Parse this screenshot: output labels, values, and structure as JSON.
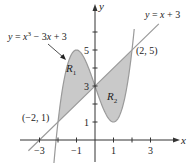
{
  "figure": {
    "type": "area-between-curves",
    "curves": [
      {
        "name": "cubic",
        "label": "y = x³ − 3x + 3",
        "label_parts": {
          "lhs": "y",
          "eq": " = ",
          "x": "x",
          "exp": "3",
          "rest": " − 3",
          "x2": "x",
          "tail": " + 3"
        }
      },
      {
        "name": "line",
        "label": "y = x + 3",
        "label_parts": {
          "lhs": "y",
          "eq": " = ",
          "x": "x",
          "tail": " + 3"
        }
      }
    ],
    "regions": [
      {
        "name": "R1",
        "base": "R",
        "sub": "1",
        "between_x": [
          -2,
          0
        ]
      },
      {
        "name": "R2",
        "base": "R",
        "sub": "2",
        "between_x": [
          0,
          2
        ]
      }
    ],
    "points": [
      {
        "label": "(−2, 1)",
        "x": -2,
        "y": 1
      },
      {
        "label": "(2, 5)",
        "x": 2,
        "y": 5
      }
    ],
    "axes": {
      "x_label": "x",
      "y_label": "y",
      "x_ticks": [
        -3,
        -2,
        -1,
        1,
        2,
        3
      ],
      "x_tick_labels": {
        "neg3": "−3",
        "neg1": "−1",
        "pos1": "1",
        "pos3": "3"
      },
      "y_ticks": [
        1,
        2,
        3,
        4,
        5,
        6
      ],
      "y_tick_labels": {
        "one": "1",
        "three": "3",
        "five": "5"
      }
    },
    "colors": {
      "shade": "#c9c9c9",
      "curve": "#9a9a9a",
      "axis": "#333333",
      "text": "#222222"
    }
  },
  "chart_data": {
    "type": "area",
    "title": "",
    "xlabel": "x",
    "ylabel": "y",
    "xlim": [
      -4,
      4.5
    ],
    "ylim": [
      -1.5,
      7.5
    ],
    "series": [
      {
        "name": "y = x^3 - 3x + 3",
        "x": [
          -2.2,
          -2,
          -1.5,
          -1,
          -0.5,
          0,
          0.5,
          1,
          1.5,
          2,
          2.2
        ],
        "y": [
          -0.05,
          1,
          4.125,
          5,
          4.375,
          3,
          1.625,
          1,
          1.875,
          5,
          7.05
        ]
      },
      {
        "name": "y = x + 3",
        "x": [
          -3.6,
          -3,
          -2,
          0,
          2,
          3.4
        ],
        "y": [
          -0.6,
          0,
          1,
          3,
          5,
          6.4
        ]
      }
    ],
    "shaded_regions": [
      {
        "name": "R1",
        "x_range": [
          -2,
          0
        ],
        "upper": "cubic",
        "lower": "line"
      },
      {
        "name": "R2",
        "x_range": [
          0,
          2
        ],
        "upper": "line",
        "lower": "cubic"
      }
    ],
    "annotations": [
      "(−2, 1)",
      "(2, 5)",
      "(0, 3)",
      "y = x³ − 3x + 3",
      "y = x + 3",
      "R1",
      "R2"
    ],
    "grid": false,
    "legend": "none"
  }
}
